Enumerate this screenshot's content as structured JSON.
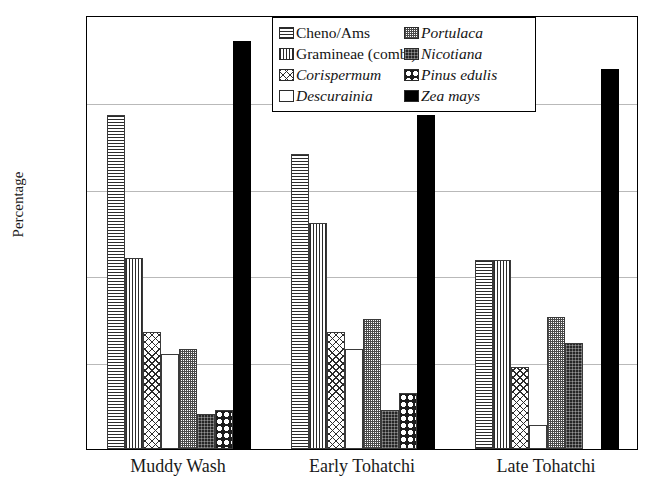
{
  "chart_data": {
    "type": "bar",
    "title": "",
    "xlabel": "",
    "ylabel": "Percentage",
    "ylim": [
      0,
      100
    ],
    "yticks": [
      0,
      20,
      40,
      60,
      80,
      100
    ],
    "grid": true,
    "legend_position": "top-center",
    "categories": [
      "Muddy Wash",
      "Early Tohatchi",
      "Late Tohatchi"
    ],
    "series": [
      {
        "name": "Cheno/Ams",
        "italic": false,
        "pattern": "horizontal-lines",
        "values": [
          77,
          68,
          43.5
        ]
      },
      {
        "name": "Gramineae (comb.)",
        "italic": false,
        "pattern": "vertical-lines",
        "values": [
          44,
          52,
          43.5
        ]
      },
      {
        "name": "Corispermum",
        "italic": true,
        "pattern": "cross-hatch",
        "values": [
          27,
          27,
          19
        ]
      },
      {
        "name": "Descurainia",
        "italic": true,
        "pattern": "empty",
        "values": [
          22,
          23,
          5.5
        ]
      },
      {
        "name": "Portulaca",
        "italic": true,
        "pattern": "stipple",
        "values": [
          23,
          30,
          30.5
        ]
      },
      {
        "name": "Nicotiana",
        "italic": true,
        "pattern": "dark-stipple",
        "values": [
          8,
          9,
          24.5
        ]
      },
      {
        "name": "Pinus edulis",
        "italic": true,
        "pattern": "circles",
        "values": [
          9,
          13,
          0
        ]
      },
      {
        "name": "Zea mays",
        "italic": true,
        "pattern": "solid-black",
        "values": [
          94,
          77,
          87.5
        ]
      }
    ]
  },
  "colors": {
    "axis": "#000000",
    "gridline": "#b9b9b9",
    "text": "#1a1a1a",
    "bar_outline": "#3a3a3a",
    "solid_fill": "#000000"
  }
}
